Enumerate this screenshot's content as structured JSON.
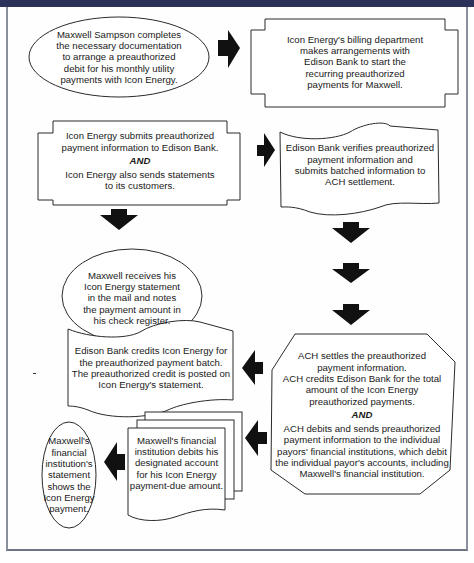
{
  "diagram": {
    "nodes": [
      {
        "id": "n1",
        "shape": "ellipse",
        "lines": [
          "Maxwell Sampson completes",
          "the necessary documentation",
          "to arrange a preauthorized",
          "debit for his monthly utility",
          "payments with Icon Energy."
        ]
      },
      {
        "id": "n2",
        "shape": "notched-rectangle",
        "lines": [
          "Icon Energy's billing department",
          "makes arrangements with",
          "Edison Bank to start the",
          "recurring preauthorized",
          "payments for Maxwell."
        ]
      },
      {
        "id": "n3",
        "shape": "notched-rectangle",
        "lines_before": [
          "Icon Energy submits preauthorized",
          "payment information to Edison Bank."
        ],
        "connector": "AND",
        "lines_after": [
          "Icon Energy also sends statements",
          "to its customers."
        ]
      },
      {
        "id": "n4",
        "shape": "punched-tape",
        "lines": [
          "Edison Bank verifies preauthorized",
          "payment information and",
          "submits batched information to",
          "ACH settlement."
        ]
      },
      {
        "id": "n5",
        "shape": "ellipse",
        "lines": [
          "Maxwell receives his",
          "Icon Energy statement",
          "in the mail and notes",
          "the payment amount in",
          "his check register."
        ]
      },
      {
        "id": "n6",
        "shape": "octagon",
        "lines_before": [
          "ACH settles the preauthorized",
          "payment information.",
          "ACH credits Edison Bank for the total",
          "amount of the Icon Energy",
          "preauthorized payments."
        ],
        "connector": "AND",
        "lines_after": [
          "ACH debits and sends preauthorized",
          "payment information to the individual",
          "payors' financial institutions, which debit",
          "the individual payor's accounts, including",
          "Maxwell's financial institution."
        ]
      },
      {
        "id": "n7",
        "shape": "punched-tape",
        "lines": [
          "Edison Bank credits Icon Energy for",
          "the preauthorized payment batch.",
          "The preauthorized credit is posted on",
          "Icon Energy's statement."
        ]
      },
      {
        "id": "n8",
        "shape": "multi-document",
        "lines": [
          "Maxwell's financial",
          "institution debits his",
          "designated account",
          "for his Icon Energy",
          "payment-due amount."
        ]
      },
      {
        "id": "n9",
        "shape": "ellipse",
        "lines": [
          "Maxwell's",
          "financial",
          "institution's",
          "statement",
          "shows the",
          "Icon Energy",
          "payment."
        ]
      }
    ],
    "edges": [
      {
        "from": "n1",
        "to": "n2",
        "direction": "right"
      },
      {
        "from": "n3",
        "to": "n4",
        "direction": "right"
      },
      {
        "from": "n3",
        "to": "n5",
        "direction": "down"
      },
      {
        "from": "n4",
        "to": "n6",
        "direction": "down",
        "arrow_count": 3
      },
      {
        "from": "n6",
        "to": "n7",
        "direction": "left"
      },
      {
        "from": "n6",
        "to": "n8",
        "direction": "left"
      },
      {
        "from": "n8",
        "to": "n9",
        "direction": "left"
      }
    ],
    "colors": {
      "header_bar": "#2b3158",
      "frame_border": "#8a8f9c",
      "shape_stroke": "#2a2a2a",
      "arrow_fill": "#111111",
      "text": "#1a1a1a"
    }
  }
}
